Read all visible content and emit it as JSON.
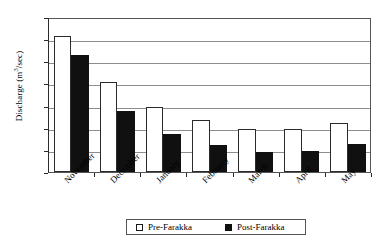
{
  "figure": {
    "title_remnant": "ˇ",
    "legend": {
      "entries": [
        {
          "label": "Pre-Farakka",
          "swatch": "hollow-square",
          "color": "#ffffff"
        },
        {
          "label": "Post-Farakka",
          "swatch": "filled-square",
          "color": "#101010"
        }
      ]
    }
  },
  "chart_data": {
    "type": "bar",
    "title": "",
    "xlabel": "",
    "ylabel": "Discharge (m³/sec)",
    "ylabel_prefix": "Discharge (m",
    "ylabel_sup": "3",
    "ylabel_suffix": "/sec)",
    "categories": [
      "November",
      "December",
      "January",
      "February",
      "March",
      "April",
      "May"
    ],
    "series": [
      {
        "name": "Pre-Farakka",
        "color": "#ffffff",
        "values": [
          6150,
          4050,
          2950,
          2350,
          1950,
          1950,
          2200
        ]
      },
      {
        "name": "Post-Farakka",
        "color": "#101010",
        "values": [
          5300,
          2750,
          1700,
          1200,
          900,
          950,
          1250
        ]
      }
    ],
    "ylim": [
      0,
      7000
    ],
    "yticks": [
      0,
      1000,
      2000,
      3000,
      4000,
      5000,
      6000,
      7000
    ],
    "ytick_labels": [
      "0",
      "1000",
      "2000",
      "3000",
      "4000",
      "5000",
      "6000",
      "7000"
    ],
    "grid": true,
    "grid_axis": "y",
    "legend_position": "bottom-center"
  }
}
